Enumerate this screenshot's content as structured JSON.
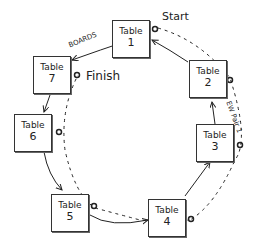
{
  "diagram": {
    "type": "movement-diagram",
    "tables": [
      {
        "label": "Table",
        "number": "1"
      },
      {
        "label": "Table",
        "number": "2"
      },
      {
        "label": "Table",
        "number": "3"
      },
      {
        "label": "Table",
        "number": "4"
      },
      {
        "label": "Table",
        "number": "5"
      },
      {
        "label": "Table",
        "number": "6"
      },
      {
        "label": "Table",
        "number": "7"
      }
    ],
    "labels": {
      "start": "Start",
      "finish": "Finish",
      "boards": "BOARDS",
      "ew_pair": "EW Pair 1"
    },
    "colors": {
      "ink": "#222222"
    }
  }
}
